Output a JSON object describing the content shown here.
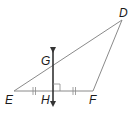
{
  "diagram": {
    "type": "geometry",
    "points": {
      "D": {
        "label": "D",
        "x": 122,
        "y": 20
      },
      "E": {
        "label": "E",
        "x": 14,
        "y": 91
      },
      "F": {
        "label": "F",
        "x": 93,
        "y": 91
      },
      "G": {
        "label": "G",
        "x": 53,
        "y": 65
      },
      "H": {
        "label": "H",
        "x": 53,
        "y": 91
      }
    },
    "segments": [
      {
        "from": "D",
        "to": "E"
      },
      {
        "from": "E",
        "to": "F"
      },
      {
        "from": "F",
        "to": "D"
      }
    ],
    "line": {
      "through": [
        "G",
        "H"
      ],
      "arrows": "both",
      "description": "perpendicular bisector of EF"
    },
    "markings": {
      "right_angle_at": "H",
      "congruent_segments": [
        [
          "E",
          "H"
        ],
        [
          "H",
          "F"
        ]
      ],
      "tick_count": 2
    },
    "colors": {
      "triangle_stroke": "#8a8a8a",
      "line_stroke": "#333333",
      "label": "#1a1a1a"
    }
  }
}
